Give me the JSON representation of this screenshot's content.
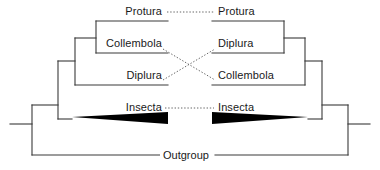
{
  "figure": {
    "type": "tanglegram-cladogram-pair",
    "title": "",
    "line_color": "#3a3a3a",
    "wedge_color": "#000000",
    "connector_color": "#555555",
    "background": "#ffffff"
  },
  "left_tree": {
    "name": "left-cladogram",
    "orientation": "tips-right",
    "taxa": [
      {
        "id": "protura",
        "label": "Protura",
        "x": 126,
        "y": 12
      },
      {
        "id": "collembola",
        "label": "Collembola",
        "x": 105,
        "y": 44
      },
      {
        "id": "diplura",
        "label": "Diplura",
        "x": 124,
        "y": 76
      },
      {
        "id": "insecta",
        "label": "Insecta",
        "x": 123,
        "y": 108
      }
    ]
  },
  "right_tree": {
    "name": "right-cladogram",
    "orientation": "tips-left",
    "taxa": [
      {
        "id": "protura",
        "label": "Protura",
        "x": 219,
        "y": 12
      },
      {
        "id": "diplura",
        "label": "Diplura",
        "x": 219,
        "y": 44
      },
      {
        "id": "collembola",
        "label": "Collembola",
        "x": 219,
        "y": 76
      },
      {
        "id": "insecta",
        "label": "Insecta",
        "x": 219,
        "y": 108
      }
    ]
  },
  "outgroup": {
    "label": "Outgroup",
    "x": 190,
    "y": 157
  },
  "connectors": [
    {
      "from": "protura",
      "to": "protura",
      "style": "dotted",
      "kind": "straight"
    },
    {
      "from": "collembola",
      "to": "collembola",
      "style": "dotted",
      "kind": "crossed"
    },
    {
      "from": "diplura",
      "to": "diplura",
      "style": "dotted",
      "kind": "crossed"
    },
    {
      "from": "insecta",
      "to": "insecta",
      "style": "dotted",
      "kind": "straight"
    }
  ]
}
